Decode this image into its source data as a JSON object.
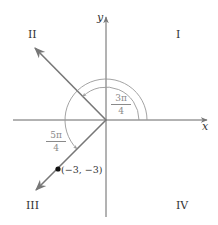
{
  "axes": {
    "x_label": "x",
    "y_label": "y"
  },
  "quadrants": {
    "I": "I",
    "II": "II",
    "III": "III",
    "IV": "IV"
  },
  "angles": {
    "inner": {
      "num": "3π",
      "den": "4"
    },
    "outer": {
      "num": "5π",
      "den": "4"
    }
  },
  "point": {
    "label": "(−3, −3)"
  },
  "colors": {
    "axis": "#555555",
    "ray": "#7a7a7a",
    "arc": "#8a8a8a",
    "angle_label": "#8a8a8a",
    "text": "#333333"
  }
}
